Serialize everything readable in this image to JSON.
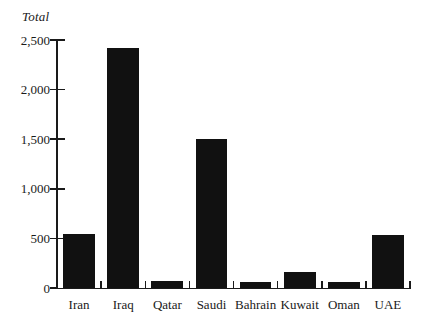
{
  "chart_data": {
    "type": "bar",
    "title": "",
    "ylabel": "Total",
    "xlabel": "",
    "categories": [
      "Iran",
      "Iraq",
      "Qatar",
      "Saudi",
      "Bahrain",
      "Kuwait",
      "Oman",
      "UAE"
    ],
    "values": [
      540,
      2420,
      70,
      1500,
      60,
      165,
      60,
      530
    ],
    "ylim": [
      0,
      2500
    ],
    "yticks": [
      0,
      500,
      1000,
      1500,
      2000,
      2500
    ],
    "ytick_labels": [
      "0",
      "500",
      "1,000",
      "1,500",
      "2,000",
      "2,500"
    ],
    "grid": false,
    "legend": null,
    "bar_color": "#111111",
    "axis_color": "#1a1a1a",
    "background": "#ffffff"
  }
}
